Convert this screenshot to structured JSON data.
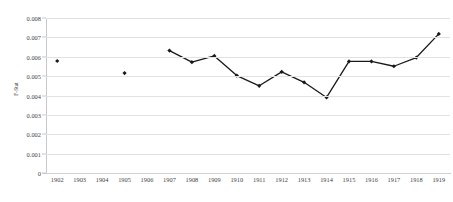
{
  "chart_data": {
    "type": "line",
    "title": "",
    "xlabel": "",
    "ylabel": "F-Stat",
    "categories": [
      "1902",
      "1903",
      "1904",
      "1905",
      "1906",
      "1907",
      "1908",
      "1909",
      "1910",
      "1911",
      "1912",
      "1913",
      "1914",
      "1915",
      "1916",
      "1917",
      "1918",
      "1919"
    ],
    "values": [
      0.00578,
      null,
      null,
      0.00516,
      null,
      0.00632,
      0.00572,
      0.00604,
      0.00503,
      0.0045,
      0.00522,
      0.00468,
      0.0039,
      0.00576,
      0.00576,
      0.00551,
      0.00596,
      0.00718
    ],
    "series": [
      {
        "name": "F-Stat",
        "values": [
          0.00578,
          null,
          null,
          0.00516,
          null,
          0.00632,
          0.00572,
          0.00604,
          0.00503,
          0.0045,
          0.00522,
          0.00468,
          0.0039,
          0.00576,
          0.00576,
          0.00551,
          0.00596,
          0.00718
        ]
      }
    ],
    "ylim": [
      0,
      0.008
    ],
    "ytick_step": 0.001,
    "ytick_labels": [
      "0.008",
      "0.007",
      "0.006",
      "0.005",
      "0.004",
      "0.003",
      "0.002",
      "0.001",
      "0"
    ],
    "ytick_values": [
      0.008,
      0.007,
      0.006,
      0.005,
      0.004,
      0.003,
      0.002,
      0.001,
      0
    ],
    "grid": "horizontal",
    "legend": "none",
    "marker": "diamond",
    "line_color": "#1a1a1a",
    "marker_color": "#1a1a1a",
    "grid_color": "#e2e2e2",
    "axis_color": "#c9c9c9",
    "text_color": "#3f3f3f",
    "background": "#ffffff"
  }
}
